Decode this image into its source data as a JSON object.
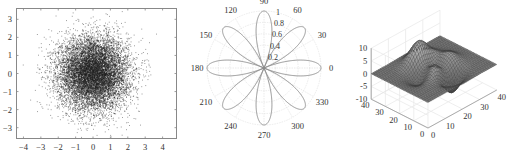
{
  "chart_data": [
    {
      "type": "scatter",
      "title": "",
      "xlabel": "",
      "ylabel": "",
      "xlim": [
        -4.4,
        4.8
      ],
      "ylim": [
        -3.6,
        3.6
      ],
      "xticks": [
        -4,
        -3,
        -2,
        -1,
        0,
        1,
        2,
        3,
        4
      ],
      "yticks": [
        -3,
        -2,
        -1,
        0,
        1,
        2,
        3
      ],
      "xtick_labels": [
        "−4",
        "−3",
        "−2",
        "−1",
        "0",
        "1",
        "2",
        "3",
        "4"
      ],
      "ytick_labels": [
        "−3",
        "−2",
        "−1",
        "0",
        "1",
        "2",
        "3"
      ],
      "grid": false,
      "marker_color": "#222222",
      "description": "Bivariate standard normal sample, ~10000 points centred at (0,0), std 1",
      "distribution": {
        "mean": [
          0,
          0
        ],
        "std": [
          1,
          1
        ],
        "n_points": 10000
      }
    },
    {
      "type": "polar",
      "title": "",
      "function": "r = |cos(4θ)|",
      "petals": 8,
      "petal_angles_deg": [
        0,
        45,
        90,
        135,
        180,
        225,
        270,
        315
      ],
      "rlim": [
        0,
        1
      ],
      "rticks": [
        0.2,
        0.4,
        0.6,
        0.8,
        1
      ],
      "rtick_labels": [
        "0.2",
        "0.4",
        "0.6",
        "0.8",
        "1"
      ],
      "theta_ticks": [
        0,
        30,
        60,
        90,
        120,
        150,
        180,
        210,
        240,
        270,
        300,
        330
      ],
      "theta_tick_labels": [
        "0",
        "30",
        "60",
        "90",
        "120",
        "150",
        "180",
        "210",
        "240",
        "270",
        "300",
        "330"
      ],
      "line_color": "#8a8a8a",
      "grid": true
    },
    {
      "type": "surface",
      "title": "",
      "function": "peaks(40)",
      "style": "mesh",
      "xlim": [
        0,
        40
      ],
      "ylim": [
        0,
        40
      ],
      "zlim": [
        -10,
        10
      ],
      "xticks": [
        0,
        10,
        20,
        30,
        40
      ],
      "yticks": [
        0,
        10,
        20,
        30,
        40
      ],
      "zticks": [
        -10,
        -5,
        0,
        5,
        10
      ],
      "xtick_labels": [
        "0",
        "10",
        "20",
        "30",
        "40"
      ],
      "ytick_labels": [
        "0",
        "10",
        "20",
        "30",
        "40"
      ],
      "ztick_labels": [
        "-10",
        "-5",
        "0",
        "5",
        "10"
      ],
      "grid": true,
      "surface_color": "#555555"
    }
  ]
}
